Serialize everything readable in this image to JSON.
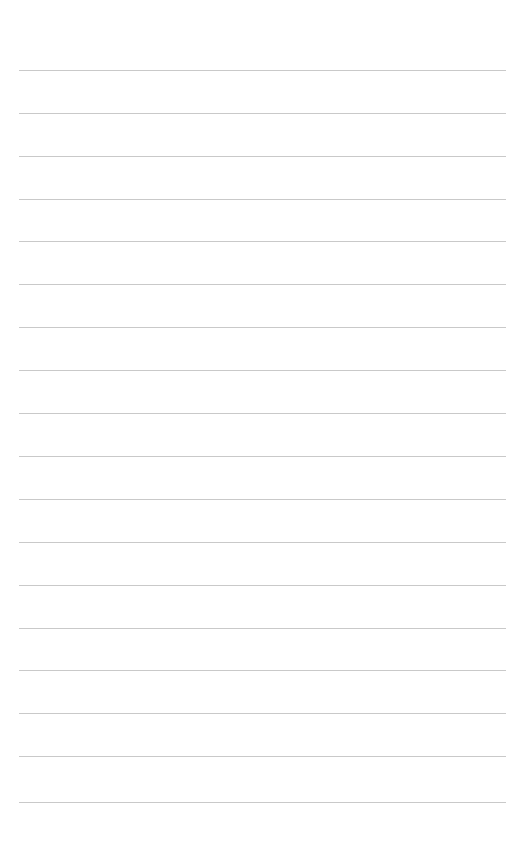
{
  "page": {
    "name": "ruled-paper-sheet",
    "width": 527,
    "height": 849,
    "background_color": "#ffffff",
    "orientation": "portrait",
    "content_text": "",
    "title_text": ""
  },
  "rules": {
    "style": "horizontal-ruled-lines",
    "count": 18,
    "color": "#c9c9c9",
    "thickness_px": 1,
    "left_x": 19,
    "right_x": 506,
    "line_width_px": 487,
    "first_line_y": 70,
    "last_line_y": 802,
    "spacing_px": 43,
    "top_margin_px": 70,
    "bottom_margin_px": 47,
    "left_margin_px": 19,
    "right_margin_px": 21,
    "y_positions": [
      70,
      113,
      156,
      199,
      241,
      284,
      327,
      370,
      413,
      456,
      499,
      542,
      585,
      628,
      670,
      713,
      756,
      802
    ]
  }
}
